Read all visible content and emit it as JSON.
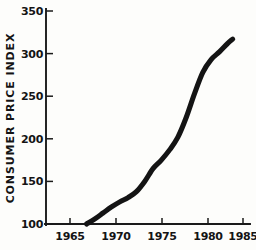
{
  "chart_data": {
    "type": "line",
    "title": "",
    "xlabel": "",
    "ylabel": "CONSUMER PRICE INDEX",
    "xlim": [
      1963.5,
      1986.5
    ],
    "ylim": [
      100,
      350
    ],
    "grid": false,
    "legend": null,
    "x_ticks": [
      "1965",
      "1970",
      "1975",
      "1980",
      "1985"
    ],
    "x_tick_values": [
      1965,
      1970,
      1975,
      1980,
      1985
    ],
    "y_ticks": [
      "100",
      "150",
      "200",
      "250",
      "300",
      "350"
    ],
    "y_tick_values": [
      100,
      150,
      200,
      250,
      300,
      350
    ],
    "series": [
      {
        "name": "Consumer Price Index",
        "x": [
          1967.0,
          1968.0,
          1969.0,
          1970.0,
          1971.0,
          1972.0,
          1973.0,
          1974.0,
          1975.0,
          1976.0,
          1977.0,
          1978.0,
          1979.0,
          1980.0,
          1981.0,
          1982.0,
          1983.0,
          1984.0,
          1984.6
        ],
        "values": [
          100,
          106,
          113,
          120,
          126,
          131,
          138,
          150,
          165,
          175,
          187,
          202,
          225,
          253,
          278,
          293,
          302,
          312,
          317
        ]
      }
    ],
    "line_color": "#141414",
    "background_color": "#fdfdfb",
    "axis_color": "#1a1a1a",
    "style": "hand-drawn"
  },
  "plot_geometry": {
    "x_axis_y": 224,
    "y_axis_x": 46,
    "x_pixels": [
      70,
      116,
      162,
      208,
      236
    ],
    "y_pixels": [
      224,
      181.4,
      138.8,
      96.2,
      53.6,
      11
    ]
  }
}
